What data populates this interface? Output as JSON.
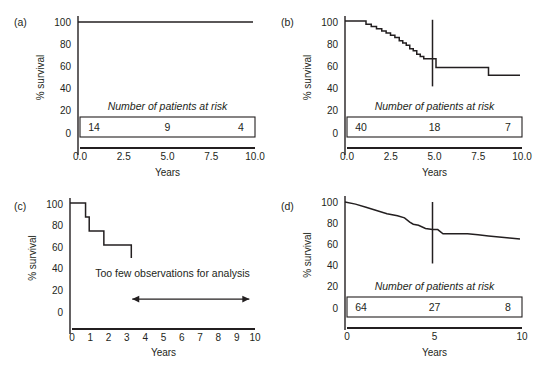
{
  "figure": {
    "shared": {
      "ylabel": "% survival",
      "xlabel": "Years",
      "risk_table_title": "Number of patients at risk",
      "y_ticks": [
        "100",
        "80",
        "60",
        "40",
        "20",
        "0"
      ],
      "y_values": [
        100,
        80,
        60,
        40,
        20,
        0
      ],
      "ylim": [
        0,
        100
      ],
      "curve_color": "#231f20",
      "background": "#ffffff"
    },
    "panels": [
      {
        "id": "a",
        "label": "(a)",
        "x_ticks": [
          "0.0",
          "2.5",
          "5.0",
          "7.5",
          "10.0"
        ],
        "x_values": [
          0,
          2.5,
          5,
          7.5,
          10
        ],
        "xlim": [
          0,
          10
        ],
        "risk_table": {
          "title": "Number of patients at risk",
          "values": [
            "14",
            "9",
            "4"
          ],
          "times": [
            0,
            5,
            10
          ]
        },
        "has_reference_line": false,
        "note": "",
        "chart_data": {
          "type": "line",
          "title": "(a)",
          "xlabel": "Years",
          "ylabel": "% survival",
          "xlim": [
            0,
            10
          ],
          "ylim": [
            0,
            100
          ],
          "grid": false,
          "legend": "none",
          "series": [
            {
              "name": "survival",
              "step": true,
              "x": [
                0,
                10
              ],
              "y": [
                100,
                100
              ]
            }
          ]
        }
      },
      {
        "id": "b",
        "label": "(b)",
        "x_ticks": [
          "0.0",
          "2.5",
          "5.0",
          "7.5",
          "10.0"
        ],
        "x_values": [
          0,
          2.5,
          5,
          7.5,
          10
        ],
        "xlim": [
          0,
          10
        ],
        "risk_table": {
          "title": "Number of patients at risk",
          "values": [
            "40",
            "18",
            "7"
          ],
          "times": [
            0,
            5,
            10
          ]
        },
        "has_reference_line": true,
        "reference_line_x": 5,
        "note": "",
        "chart_data": {
          "type": "line",
          "title": "(b)",
          "xlabel": "Years",
          "ylabel": "% survival",
          "xlim": [
            0,
            10
          ],
          "ylim": [
            0,
            100
          ],
          "grid": false,
          "legend": "none",
          "annotations": [
            {
              "type": "vline",
              "x": 5,
              "y_from": 42,
              "y_to": 102
            }
          ],
          "series": [
            {
              "name": "survival",
              "step": true,
              "x": [
                0.0,
                0.9,
                1.2,
                1.5,
                1.8,
                2.1,
                2.35,
                2.6,
                2.85,
                3.1,
                3.3,
                3.5,
                3.7,
                3.9,
                4.1,
                4.3,
                4.5,
                5.2,
                8.2,
                10.0
              ],
              "y": [
                101,
                101,
                98,
                96,
                94,
                92,
                90,
                88,
                86,
                83,
                81,
                79,
                76,
                74,
                71,
                69,
                67,
                59,
                52,
                52
              ]
            }
          ]
        }
      },
      {
        "id": "c",
        "label": "(c)",
        "x_ticks": [
          "0",
          "1",
          "2",
          "3",
          "4",
          "5",
          "6",
          "7",
          "8",
          "9",
          "10"
        ],
        "x_values": [
          0,
          1,
          2,
          3,
          4,
          5,
          6,
          7,
          8,
          9,
          10
        ],
        "xlim": [
          0,
          10
        ],
        "risk_table": null,
        "has_reference_line": false,
        "note": "Too few observations for analysis",
        "arrow": {
          "from_x": 3.4,
          "to_x": 9.8,
          "y": 12,
          "double_headed": true
        },
        "chart_data": {
          "type": "line",
          "title": "(c)",
          "xlabel": "Years",
          "ylabel": "% survival",
          "xlim": [
            0,
            10
          ],
          "ylim": [
            0,
            100
          ],
          "grid": false,
          "legend": "none",
          "annotations": [
            {
              "type": "text",
              "text": "Too few observations for analysis",
              "x": 5.6,
              "y": 32
            },
            {
              "type": "arrow",
              "x_from": 3.4,
              "x_to": 9.8,
              "y": 12
            }
          ],
          "series": [
            {
              "name": "survival",
              "step": true,
              "x": [
                0.0,
                0.55,
                0.85,
                1.05,
                1.65,
                1.85,
                3.35
              ],
              "y": [
                101,
                101,
                88,
                75,
                75,
                62,
                50
              ]
            }
          ]
        }
      },
      {
        "id": "d",
        "label": "(d)",
        "x_ticks": [
          "0",
          "5",
          "10"
        ],
        "x_values": [
          0,
          5,
          10
        ],
        "xlim": [
          0,
          10
        ],
        "risk_table": {
          "title": "Number of patients at risk",
          "values": [
            "64",
            "27",
            "8"
          ],
          "times": [
            0,
            5,
            10
          ]
        },
        "has_reference_line": true,
        "reference_line_x": 5,
        "note": "",
        "chart_data": {
          "type": "line",
          "title": "(d)",
          "xlabel": "Years",
          "ylabel": "% survival",
          "xlim": [
            0,
            10
          ],
          "ylim": [
            0,
            100
          ],
          "grid": false,
          "legend": "none",
          "annotations": [
            {
              "type": "vline",
              "x": 5,
              "y_from": 42,
              "y_to": 100
            }
          ],
          "series": [
            {
              "name": "survival",
              "step": false,
              "x": [
                0.0,
                0.6,
                1.2,
                1.8,
                2.4,
                3.0,
                3.4,
                3.7,
                3.9,
                4.2,
                4.6,
                5.0,
                5.3,
                5.6,
                6.2,
                7.0,
                7.6,
                8.2,
                8.8,
                9.4,
                10.0
              ],
              "y": [
                100,
                98,
                95,
                92,
                89,
                87,
                85,
                81,
                79,
                78,
                75,
                74,
                74,
                70,
                70,
                70,
                69,
                68,
                67,
                66,
                65
              ]
            }
          ]
        }
      }
    ]
  }
}
